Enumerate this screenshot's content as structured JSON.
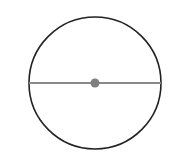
{
  "diagram": {
    "type": "circle-with-diameter",
    "circle": {
      "cx": 95,
      "cy": 83,
      "r": 66,
      "stroke": "#222222",
      "stroke_width": 1.6
    },
    "diameter": {
      "x1": 29,
      "y1": 83,
      "x2": 161,
      "y2": 83,
      "stroke": "#8a8a8a",
      "stroke_width": 1.8
    },
    "center_point": {
      "cx": 95,
      "cy": 83,
      "r": 4.5,
      "fill": "#808080"
    }
  }
}
